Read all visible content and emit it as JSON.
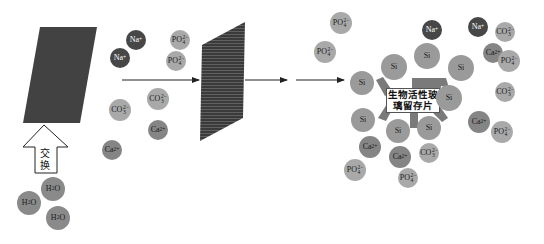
{
  "diagram": {
    "title": "",
    "colors": {
      "na": "#474747",
      "ca": "#858585",
      "co3": "#a9a9a9",
      "po4": "#a9a9a9",
      "si": "#9a9a9a",
      "h2o": "#8a8a8a",
      "plate": "#3e3e3e",
      "scaffold": "#7a7a7a"
    },
    "exchange_arrow": {
      "label_line1": "交",
      "label_line2": "换"
    },
    "scaffold_label": {
      "line1": "生物活性玻",
      "line2": "璃留存片"
    },
    "ion_labels": {
      "na": {
        "base": "Na",
        "sup": "+"
      },
      "ca": {
        "base": "Ca",
        "sup": "2+"
      },
      "co3": {
        "base": "CO",
        "sup": "2−",
        "sub": "3"
      },
      "po4": {
        "base": "PO",
        "sup": "2−",
        "sub": "4"
      },
      "si": {
        "base": "Si"
      },
      "h2o": {
        "base": "H",
        "sub": "2",
        "tail": "O"
      }
    },
    "stages": [
      {
        "name": "bioactive-glass-plate",
        "description": "dark plate (initial)"
      },
      {
        "name": "released-ions",
        "ions": [
          "Na+",
          "Na+",
          "PO4",
          "PO4",
          "CO3",
          "CO3",
          "Ca2+",
          "Ca2+"
        ]
      },
      {
        "name": "membrane-plate",
        "description": "hatched plate"
      },
      {
        "name": "residual-scaffold",
        "ions": [
          "Si x10",
          "Na+ x2",
          "Ca2+ x5",
          "CO3 x4",
          "PO4 x8"
        ]
      }
    ],
    "water_molecules": [
      "H2O",
      "H2O",
      "H2O"
    ]
  }
}
